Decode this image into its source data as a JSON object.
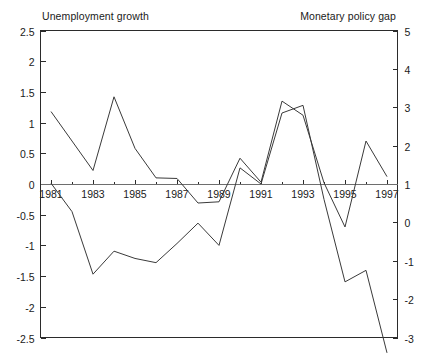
{
  "chart_data": {
    "type": "line",
    "title": "",
    "xlabel": "",
    "grid": false,
    "legend_position": "top",
    "axes": {
      "x": {
        "min": 1980.5,
        "max": 1997.5,
        "tick_labels": [
          "1981",
          "1983",
          "1985",
          "1987",
          "1989",
          "1991",
          "1993",
          "1995",
          "1997"
        ],
        "tick_values": [
          1981,
          1983,
          1985,
          1987,
          1989,
          1991,
          1993,
          1995,
          1997
        ],
        "minor_tick_step": 1
      },
      "y_left": {
        "label": "Unemployment growth",
        "min": -2.5,
        "max": 2.5,
        "tick_labels": [
          "2.5",
          "2",
          "1.5",
          "1",
          "0.5",
          "0",
          "-0.5",
          "-1",
          "-1.5",
          "-2",
          "-2.5"
        ],
        "tick_values": [
          2.5,
          2,
          1.5,
          1,
          0.5,
          0,
          -0.5,
          -1,
          -1.5,
          -2,
          -2.5
        ]
      },
      "y_right": {
        "label": "Monetary policy gap",
        "min": -3,
        "max": 5,
        "tick_labels": [
          "5",
          "4",
          "3",
          "2",
          "1",
          "0",
          "-1",
          "-2",
          "-3"
        ],
        "tick_values": [
          5,
          4,
          3,
          2,
          1,
          0,
          -1,
          -2,
          -3
        ]
      }
    },
    "series": [
      {
        "name": "Unemployment growth",
        "axis": "left",
        "color": "#3a3a3a",
        "x": [
          1981,
          1982,
          1983,
          1984,
          1985,
          1986,
          1987,
          1988,
          1989,
          1990,
          1991,
          1992,
          1993,
          1994,
          1995,
          1996,
          1997
        ],
        "values": [
          1.18,
          0.7,
          0.22,
          1.42,
          0.58,
          0.1,
          0.09,
          -0.31,
          -0.29,
          0.42,
          0.03,
          1.35,
          1.12,
          0.02,
          -0.7,
          0.7,
          0.12
        ]
      },
      {
        "name": "Monetary policy gap",
        "axis": "right",
        "color": "#3a3a3a",
        "x": [
          1981,
          1982,
          1983,
          1984,
          1985,
          1986,
          1987,
          1988,
          1989,
          1990,
          1991,
          1992,
          1993,
          1994,
          1995,
          1996,
          1997
        ],
        "values": [
          1.02,
          0.28,
          -1.35,
          -0.75,
          -0.94,
          -1.05,
          -0.55,
          -0.02,
          -0.6,
          1.42,
          1.0,
          2.85,
          3.05,
          0.6,
          -1.55,
          -1.25,
          -3.4
        ]
      }
    ]
  }
}
